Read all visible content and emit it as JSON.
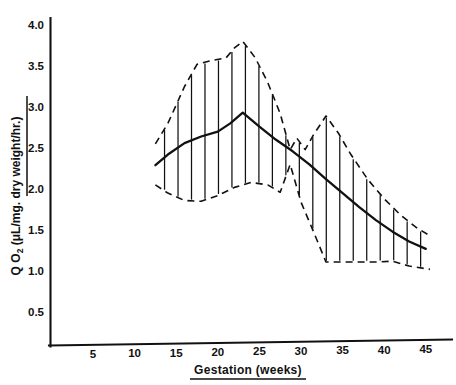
{
  "figure": {
    "background_color": "#ffffff",
    "ink_color": "#111111"
  },
  "axes": {
    "y_title_main": "Q O",
    "y_title_sub": "2",
    "y_title_rest": " (μL/mg. dry weight/hr.)",
    "y_title_full": "Q O2 (μL/mg. dry weight/hr.)",
    "x_title": "Gestation  (weeks)",
    "y_ticks": [
      "0.5",
      "1.0",
      "1.5",
      "2.0",
      "2.5",
      "3.0",
      "3.5",
      "4.0"
    ],
    "x_ticks": [
      "5",
      "10",
      "15",
      "20",
      "25",
      "30",
      "35",
      "40",
      "45"
    ]
  },
  "chart_data": {
    "type": "line",
    "title": "",
    "subtitle": "",
    "xlabel": "Gestation (weeks)",
    "ylabel": "Q O2 (μL/mg. dry weight/hr.)",
    "xlim": [
      0,
      48
    ],
    "ylim": [
      0,
      4.25
    ],
    "grid": false,
    "legend": null,
    "x_tick_values": [
      5,
      10,
      15,
      20,
      25,
      30,
      35,
      40,
      45
    ],
    "y_tick_values": [
      0.5,
      1.0,
      1.5,
      2.0,
      2.5,
      3.0,
      3.5,
      4.0
    ],
    "annotations": [
      "Solid line is the mean curve",
      "Dashed lines are upper and lower range boundaries",
      "Vertical hatching fills the range band"
    ],
    "series": [
      {
        "name": "Mean QO2",
        "style": "solid",
        "x": [
          12.5,
          14.0,
          16.0,
          18.0,
          20.0,
          21.5,
          23.0,
          25.0,
          27.0,
          29.0,
          31.0,
          33.0,
          35.0,
          37.0,
          39.0,
          41.0,
          43.0,
          45.0
        ],
        "values": [
          2.29,
          2.42,
          2.56,
          2.64,
          2.7,
          2.8,
          2.93,
          2.76,
          2.6,
          2.46,
          2.3,
          2.12,
          1.95,
          1.78,
          1.62,
          1.48,
          1.36,
          1.27
        ]
      },
      {
        "name": "Upper range",
        "style": "dashed",
        "x": [
          12.5,
          14.0,
          16.0,
          17.5,
          19.0,
          21.0,
          22.0,
          23.0,
          24.5,
          26.0,
          27.5,
          28.7,
          29.5,
          30.5,
          31.5,
          33.0,
          34.5,
          36.0,
          38.0,
          40.0,
          42.0,
          44.0,
          45.5
        ],
        "values": [
          2.55,
          2.8,
          3.25,
          3.52,
          3.56,
          3.6,
          3.72,
          3.8,
          3.6,
          3.3,
          2.92,
          2.48,
          2.62,
          2.48,
          2.66,
          2.89,
          2.68,
          2.42,
          2.12,
          1.88,
          1.68,
          1.52,
          1.43
        ]
      },
      {
        "name": "Lower range",
        "style": "dashed",
        "x": [
          12.5,
          14.0,
          16.0,
          18.0,
          20.0,
          22.0,
          24.0,
          26.0,
          27.5,
          28.7,
          30.0,
          31.5,
          33.0,
          35.0,
          37.0,
          39.0,
          41.0,
          43.0,
          45.5
        ],
        "values": [
          2.05,
          1.95,
          1.86,
          1.85,
          1.92,
          2.02,
          2.08,
          2.05,
          1.96,
          2.3,
          1.84,
          1.48,
          1.11,
          1.11,
          1.11,
          1.11,
          1.12,
          1.06,
          1.02
        ]
      }
    ]
  }
}
